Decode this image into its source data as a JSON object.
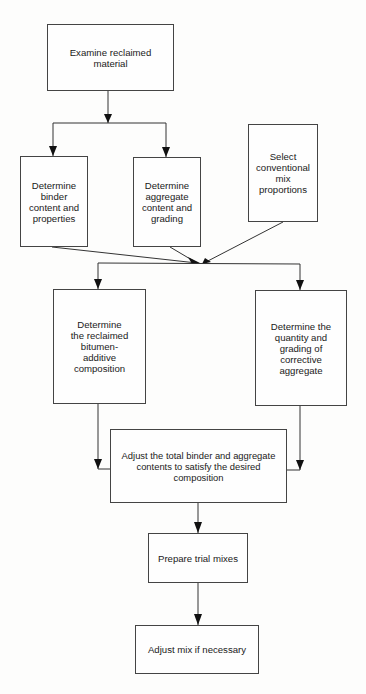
{
  "diagram": {
    "type": "flowchart",
    "nodes": {
      "examine": {
        "label": "Examine reclaimed\nmaterial"
      },
      "binder": {
        "label": "Determine\nbinder\ncontent and\nproperties"
      },
      "aggregate": {
        "label": "Determine\naggregate\ncontent and\ngrading"
      },
      "conventional": {
        "label": "Select\nconventional\nmix\nproportions"
      },
      "bitumen": {
        "label": "Determine\nthe reclaimed\nbitumen-\nadditive\ncomposition"
      },
      "corrective": {
        "label": "Determine the\nquantity and\ngrading of\ncorrective\naggregate"
      },
      "adjust_total": {
        "label": "Adjust the total binder and aggregate\ncontents to satisfy the desired\ncomposition"
      },
      "trial": {
        "label": "Prepare trial mixes"
      },
      "adjust_mix": {
        "label": "Adjust mix if necessary"
      }
    },
    "edges": [
      {
        "from": "examine",
        "to": "binder"
      },
      {
        "from": "examine",
        "to": "aggregate"
      },
      {
        "from": "binder",
        "to": "merge_point"
      },
      {
        "from": "aggregate",
        "to": "merge_point"
      },
      {
        "from": "conventional",
        "to": "merge_point"
      },
      {
        "from": "merge_point",
        "to": "bitumen"
      },
      {
        "from": "merge_point",
        "to": "corrective"
      },
      {
        "from": "bitumen",
        "to": "adjust_total"
      },
      {
        "from": "corrective",
        "to": "adjust_total"
      },
      {
        "from": "adjust_total",
        "to": "trial"
      },
      {
        "from": "trial",
        "to": "adjust_mix"
      }
    ],
    "colors": {
      "line": "#333333",
      "box_border": "#444444",
      "background": "#fdfdfc",
      "text": "#1a1a1a"
    }
  }
}
